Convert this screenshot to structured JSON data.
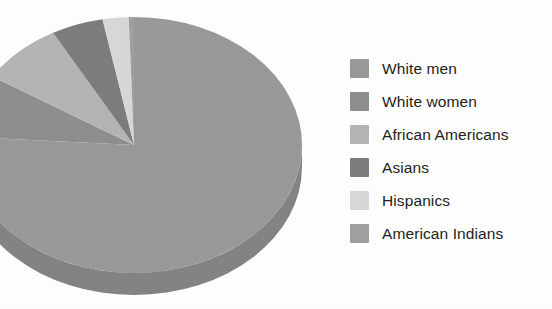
{
  "chart_data": {
    "type": "pie",
    "title": "",
    "subtitle": "",
    "xlabel": "",
    "ylabel": "",
    "legend_position": "right",
    "grid": false,
    "three_d": true,
    "categories": [
      "White men",
      "White women",
      "African Americans",
      "Asians",
      "Hispanics",
      "American Indians"
    ],
    "values": [
      76,
      8,
      8,
      5,
      2.5,
      0.5
    ],
    "slices": [
      {
        "label": "White men",
        "value": 76,
        "color": "#9a9a9a",
        "start_angle": 0,
        "end_angle": 273.6
      },
      {
        "label": "White women",
        "value": 8,
        "color": "#8f8f8f",
        "start_angle": 273.6,
        "end_angle": 302.4
      },
      {
        "label": "African Americans",
        "value": 8,
        "color": "#b5b5b5",
        "start_angle": 302.4,
        "end_angle": 331.2
      },
      {
        "label": "Asians",
        "value": 5,
        "color": "#7d7d7d",
        "start_angle": 331.2,
        "end_angle": 349.2
      },
      {
        "label": "Hispanics",
        "value": 2.5,
        "color": "#d8d8d8",
        "start_angle": 349.2,
        "end_angle": 358.2
      },
      {
        "label": "American Indians",
        "value": 0.5,
        "color": "#a0a0a0",
        "start_angle": 358.2,
        "end_angle": 360
      }
    ]
  },
  "legend": {
    "items": [
      {
        "label": "White men",
        "color": "#9a9a9a"
      },
      {
        "label": "White women",
        "color": "#8f8f8f"
      },
      {
        "label": "African Americans",
        "color": "#b5b5b5"
      },
      {
        "label": "Asians",
        "color": "#7d7d7d"
      },
      {
        "label": "Hispanics",
        "color": "#d8d8d8"
      },
      {
        "label": "American Indians",
        "color": "#a0a0a0"
      }
    ]
  },
  "colors": {
    "background": "#ffffff",
    "text": "#231f20",
    "white_men": "#9a9a9a",
    "white_women": "#8f8f8f",
    "african_americans": "#b5b5b5",
    "asians": "#7d7d7d",
    "hispanics": "#d8d8d8",
    "american_indians": "#a0a0a0"
  }
}
